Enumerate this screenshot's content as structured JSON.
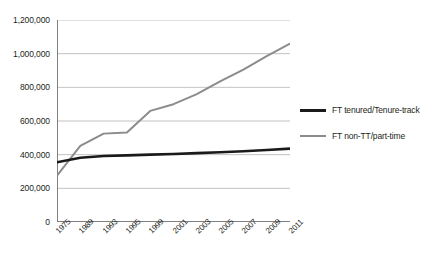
{
  "chart_data": {
    "type": "line",
    "title": "",
    "subtitle": "",
    "xlabel": "",
    "ylabel": "",
    "grid": true,
    "legend_position": "right",
    "ylim": [
      0,
      1200000
    ],
    "yticks": [
      0,
      200000,
      400000,
      600000,
      800000,
      1000000,
      1200000
    ],
    "ytick_labels": [
      "0",
      "200,000",
      "400,000",
      "600,000",
      "800,000",
      "1,000,000",
      "1,200,000"
    ],
    "x": [
      1975,
      1989,
      1993,
      1995,
      1999,
      2001,
      2003,
      2005,
      2007,
      2009,
      2011
    ],
    "xtick_labels": [
      "1975",
      "1989",
      "1993",
      "1995",
      "1999",
      "2001",
      "2003",
      "2005",
      "2007",
      "2009",
      "2011"
    ],
    "series": [
      {
        "name": "FT tenured/Tenure-track",
        "color": "#1a1a1a",
        "values": [
          355000,
          382000,
          392000,
          396000,
          400000,
          404000,
          409000,
          414000,
          420000,
          428000,
          436000
        ]
      },
      {
        "name": "FT non-TT/part-time",
        "color": "#8c8c8c",
        "values": [
          275000,
          452000,
          525000,
          532000,
          660000,
          700000,
          760000,
          835000,
          905000,
          985000,
          1060000
        ]
      }
    ]
  },
  "legend": {
    "items": [
      {
        "label": "FT tenured/Tenure-track",
        "color": "#1a1a1a"
      },
      {
        "label": "FT non-TT/part-time",
        "color": "#8c8c8c"
      }
    ]
  },
  "axes": {
    "axis_color": "#808080",
    "grid_color": "#b3b3b3"
  }
}
